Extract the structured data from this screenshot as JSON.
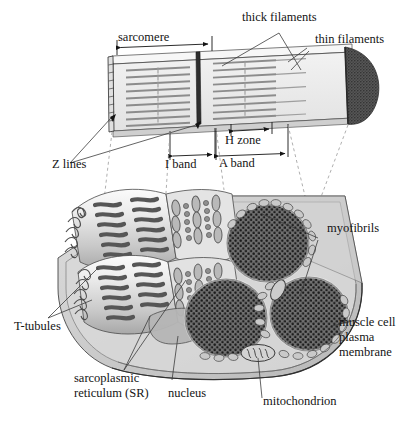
{
  "figure": {
    "background_color": "#ffffff",
    "ink_color": "#141414"
  },
  "palette": {
    "ink": "#141414",
    "leader_line": "#3c3c3c",
    "dashed_guide": "#8a8a8a",
    "myofibril_light": "#e9e9e9",
    "myofibril_mid": "#bdbdbd",
    "myofibril_dark": "#6b6b6b",
    "myosin_band": "#585858",
    "cross_section_fill": "#6e6e6e",
    "cross_section_dot": "#1e1e1e",
    "membrane_fill": "#cfcfcf",
    "sarcomere_face": "#ececec",
    "sarcomere_side": "#d6d6d6",
    "filament_gray": "#8c8c8c",
    "end_cap": "#555555"
  },
  "upper_panel": {
    "name": "sarcomere-myofibril-diagram",
    "labels": {
      "sarcomere": "sarcomere",
      "thick_filaments": "thick filaments",
      "thin_filaments": "thin filaments",
      "z_lines": "Z lines",
      "i_band": "I band",
      "a_band": "A band",
      "h_zone": "H zone"
    },
    "measure_bars": [
      {
        "name": "sarcomere-measure",
        "label": "sarcomere",
        "style": "double-arrow-with-end-ticks"
      },
      {
        "name": "h-zone-measure",
        "label": "H zone",
        "style": "double-arrow-with-end-ticks"
      },
      {
        "name": "i-band-measure",
        "label": "I band",
        "style": "double-arrow-with-end-ticks"
      },
      {
        "name": "a-band-measure",
        "label": "A band",
        "style": "double-arrow-with-end-ticks"
      }
    ],
    "filament_rows": 9
  },
  "lower_panel": {
    "name": "muscle-fiber-cutaway-diagram",
    "labels": {
      "myofibrils": "myofibrils",
      "muscle_cell_plasma_membrane_line1": "muscle cell",
      "muscle_cell_plasma_membrane_line2": "plasma",
      "muscle_cell_plasma_membrane_line3": "membrane",
      "t_tubules": "T-tubules",
      "sarcoplasmic_reticulum_line1": "sarcoplasmic",
      "sarcoplasmic_reticulum_line2": "reticulum (SR)",
      "nucleus": "nucleus",
      "mitochondrion": "mitochondrion"
    },
    "cross_sections": [
      {
        "name": "myofibril-cross-section-top",
        "cx": 268,
        "cy": 243,
        "rx": 41,
        "ry": 39
      },
      {
        "name": "myofibril-cross-section-left",
        "cx": 226,
        "cy": 318,
        "rx": 41,
        "ry": 39
      },
      {
        "name": "myofibril-cross-section-right",
        "cx": 309,
        "cy": 314,
        "rx": 39,
        "ry": 37
      }
    ],
    "organelles": [
      {
        "name": "mitochondrion-shape",
        "cx": 258,
        "cy": 353
      },
      {
        "name": "nucleus-shape",
        "cx": 175,
        "cy": 318
      }
    ]
  }
}
